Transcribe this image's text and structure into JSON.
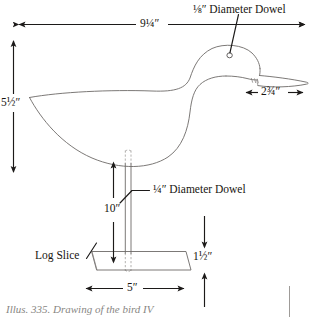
{
  "figure": {
    "caption": "Illus. 335. Drawing of the bird IV",
    "ink_color": "#1c1a19",
    "outline_color": "#6d6a68",
    "paper_color": "#ffffff"
  },
  "annotations": {
    "dowel_top_label": "⅛″ Diameter Dowel",
    "dowel_leg_label": "¼″ Diameter Dowel",
    "base_label": "Log Slice"
  },
  "dimensions": [
    {
      "id": "body-length",
      "value": "9¼″",
      "orientation": "horizontal"
    },
    {
      "id": "body-height",
      "value": "5½″",
      "orientation": "vertical"
    },
    {
      "id": "beak-length",
      "value": "2¾″",
      "orientation": "horizontal"
    },
    {
      "id": "leg-height",
      "value": "10″",
      "orientation": "vertical"
    },
    {
      "id": "base-thickness",
      "value": "1½″",
      "orientation": "vertical"
    },
    {
      "id": "base-width",
      "value": "5″",
      "orientation": "horizontal"
    }
  ]
}
